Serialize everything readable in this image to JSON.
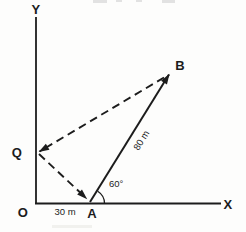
{
  "figure": {
    "background": "#fdfdfc",
    "ink_color": "#1c1c1c",
    "labels": {
      "y_axis": "Y",
      "x_axis": "X",
      "origin": "O",
      "point_a": "A",
      "point_b": "B",
      "point_q": "Q",
      "oa_distance": "30 m",
      "ab_distance": "80 m",
      "angle_at_a": "60°"
    },
    "measurements": {
      "oa_meters": 30,
      "ab_meters": 80,
      "angle_a_degrees": 60
    },
    "segments": [
      {
        "name": "A-to-B",
        "style": "solid",
        "arrow_at": "B",
        "label": "80 m"
      },
      {
        "name": "B-to-Q",
        "style": "dashed",
        "arrow_at": "Q",
        "label": ""
      },
      {
        "name": "Q-to-A",
        "style": "dashed",
        "arrow_at": "A",
        "label": ""
      }
    ]
  }
}
